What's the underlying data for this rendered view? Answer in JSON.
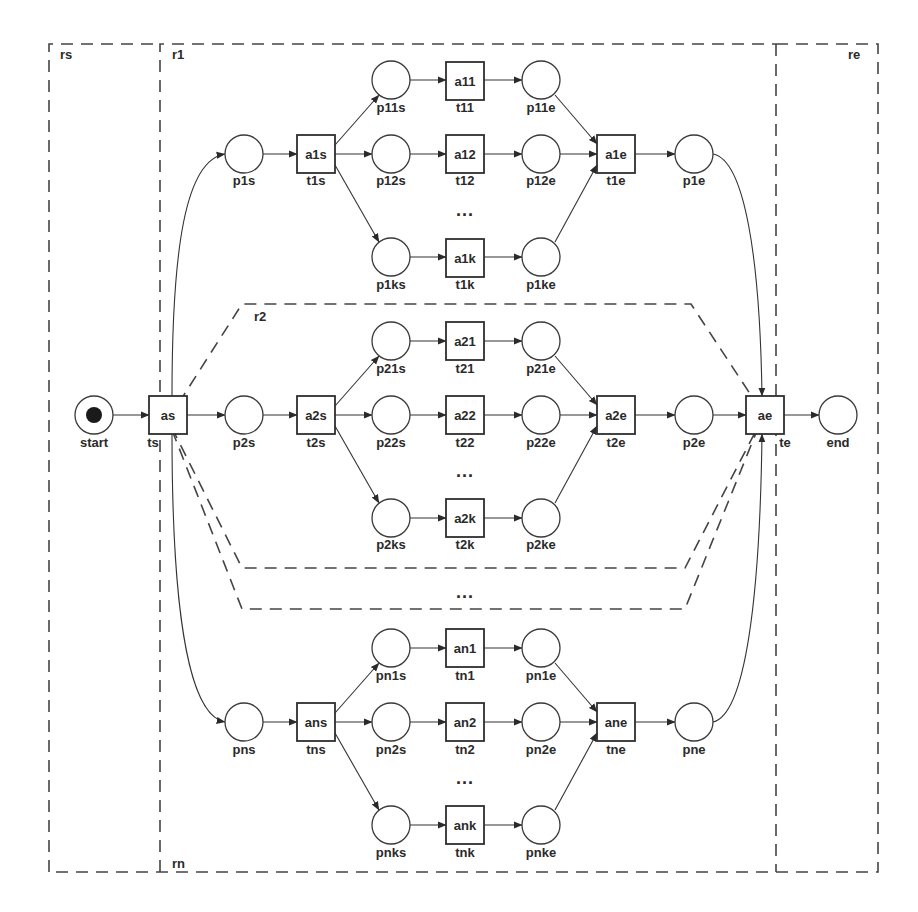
{
  "diagram": {
    "type": "petri-net",
    "colors": {
      "stroke": "#333333",
      "background": "#ffffff",
      "token": "#1a1a1a"
    },
    "regions": [
      {
        "id": "rs",
        "label": "rs"
      },
      {
        "id": "r1",
        "label": "r1"
      },
      {
        "id": "r2",
        "label": "r2"
      },
      {
        "id": "rn",
        "label": "rn"
      },
      {
        "id": "re",
        "label": "re"
      }
    ],
    "start": {
      "place": "start",
      "transition_name": "as",
      "transition_label": "ts"
    },
    "end": {
      "place": "end",
      "transition_name": "ae",
      "transition_label": "te"
    },
    "branches": [
      {
        "entry_place": "p1s",
        "split_name": "a1s",
        "split_label": "t1s",
        "join_name": "a1e",
        "join_label": "t1e",
        "exit_place": "p1e",
        "rows": [
          {
            "in_place": "p11s",
            "activity": "a11",
            "transition": "t11",
            "out_place": "p11e"
          },
          {
            "in_place": "p12s",
            "activity": "a12",
            "transition": "t12",
            "out_place": "p12e"
          },
          {
            "in_place": "p1ks",
            "activity": "a1k",
            "transition": "t1k",
            "out_place": "p1ke"
          }
        ]
      },
      {
        "entry_place": "p2s",
        "split_name": "a2s",
        "split_label": "t2s",
        "join_name": "a2e",
        "join_label": "t2e",
        "exit_place": "p2e",
        "rows": [
          {
            "in_place": "p21s",
            "activity": "a21",
            "transition": "t21",
            "out_place": "p21e"
          },
          {
            "in_place": "p22s",
            "activity": "a22",
            "transition": "t22",
            "out_place": "p22e"
          },
          {
            "in_place": "p2ks",
            "activity": "a2k",
            "transition": "t2k",
            "out_place": "p2ke"
          }
        ]
      },
      {
        "entry_place": "pns",
        "split_name": "ans",
        "split_label": "tns",
        "join_name": "ane",
        "join_label": "tne",
        "exit_place": "pne",
        "rows": [
          {
            "in_place": "pn1s",
            "activity": "an1",
            "transition": "tn1",
            "out_place": "pn1e"
          },
          {
            "in_place": "pn2s",
            "activity": "an2",
            "transition": "tn2",
            "out_place": "pn2e"
          },
          {
            "in_place": "pnks",
            "activity": "ank",
            "transition": "tnk",
            "out_place": "pnke"
          }
        ]
      }
    ],
    "ellipsis": "..."
  }
}
